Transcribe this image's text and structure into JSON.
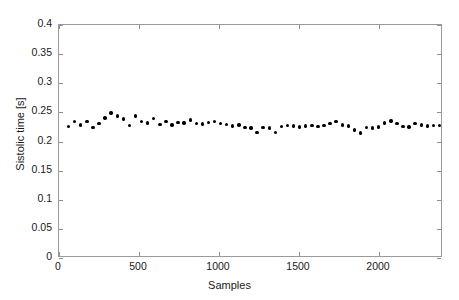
{
  "chart_data": {
    "type": "scatter",
    "title": "",
    "xlabel": "Samples",
    "ylabel": "Sistolic time [s]",
    "xlim": [
      0,
      2400
    ],
    "ylim": [
      0,
      0.4
    ],
    "xticks": [
      0,
      500,
      1000,
      1500,
      2000
    ],
    "xtick_labels": [
      "0",
      "500",
      "1000",
      "1500",
      "2000"
    ],
    "yticks": [
      0,
      0.05,
      0.1,
      0.15,
      0.2,
      0.25,
      0.3,
      0.35,
      0.4
    ],
    "ytick_labels": [
      "0",
      "0.05",
      "0.1",
      "0.15",
      "0.2",
      "0.25",
      "0.3",
      "0.35",
      "0.4"
    ],
    "grid": false,
    "legend": null,
    "marker": "filled-circle",
    "marker_color": "#000000",
    "box": true,
    "series": [
      {
        "name": "Sistolic time",
        "x": [
          60,
          98,
          136,
          174,
          212,
          250,
          288,
          326,
          364,
          402,
          440,
          478,
          516,
          554,
          592,
          630,
          668,
          706,
          744,
          782,
          820,
          858,
          896,
          934,
          972,
          1010,
          1048,
          1086,
          1124,
          1162,
          1200,
          1238,
          1276,
          1314,
          1352,
          1390,
          1428,
          1466,
          1504,
          1542,
          1580,
          1618,
          1656,
          1694,
          1732,
          1770,
          1808,
          1846,
          1884,
          1922,
          1960,
          1998,
          2036,
          2074,
          2112,
          2150,
          2188,
          2226,
          2264,
          2302,
          2340,
          2378
        ],
        "y": [
          0.2255,
          0.2345,
          0.2285,
          0.234,
          0.224,
          0.2305,
          0.2405,
          0.249,
          0.2435,
          0.2385,
          0.2275,
          0.244,
          0.234,
          0.232,
          0.2395,
          0.229,
          0.234,
          0.2285,
          0.2325,
          0.232,
          0.237,
          0.231,
          0.23,
          0.2325,
          0.2345,
          0.231,
          0.2295,
          0.2265,
          0.2285,
          0.2245,
          0.223,
          0.215,
          0.224,
          0.223,
          0.2155,
          0.2255,
          0.227,
          0.2265,
          0.225,
          0.2265,
          0.228,
          0.2255,
          0.227,
          0.2305,
          0.234,
          0.2285,
          0.2265,
          0.2195,
          0.2145,
          0.224,
          0.2235,
          0.225,
          0.232,
          0.2355,
          0.231,
          0.2255,
          0.225,
          0.2305,
          0.2285,
          0.2265,
          0.227,
          0.227
        ]
      }
    ]
  }
}
